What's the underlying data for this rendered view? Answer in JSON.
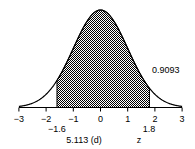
{
  "chart_data": {
    "type": "area",
    "title": "",
    "xlabel": "z",
    "ylabel": "",
    "xlim": [
      -3,
      3
    ],
    "x_ticks": [
      -3,
      -2,
      -1,
      0,
      1,
      2,
      3
    ],
    "x_tick_labels": [
      "−3",
      "−2",
      "−1",
      "0",
      "1",
      "2",
      "3"
    ],
    "shaded_region": {
      "from": -1.6,
      "to": 1.8,
      "area": 0.9093
    },
    "grid": false,
    "legend": null,
    "annotations": {
      "area_label": "0.9093",
      "lower_bound_label": "−1.6",
      "upper_bound_label": "1.8",
      "figure_label": "5.113 (d)",
      "axis_variable": "z"
    }
  }
}
